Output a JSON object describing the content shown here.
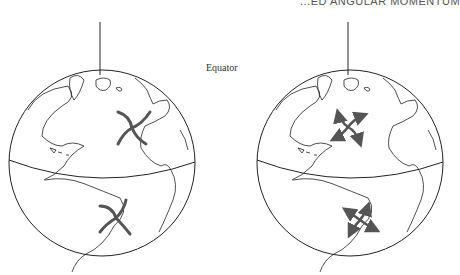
{
  "header": {
    "text": "...ED ANGULAR MOMENTUM"
  },
  "labels": {
    "equator": "Equator"
  },
  "figure": {
    "globes": [
      {
        "name": "left-globe",
        "description": "Earth globe showing Atlantic with curved-arm (inward) circulation pattern in each hemisphere"
      },
      {
        "name": "right-globe",
        "description": "Earth globe showing Atlantic with arrowed (outward) circulation pattern in each hemisphere"
      }
    ],
    "colors": {
      "line": "#222222",
      "arrows": "#555555"
    }
  }
}
